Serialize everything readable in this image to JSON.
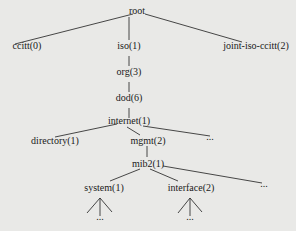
{
  "diagram": {
    "type": "tree",
    "nodes": [
      {
        "id": "root",
        "label": "root",
        "x": 149,
        "y": 12
      },
      {
        "id": "ccitt",
        "label": "ccitt(0)",
        "x": 30,
        "y": 45
      },
      {
        "id": "iso",
        "label": "iso(1)",
        "x": 130,
        "y": 45
      },
      {
        "id": "joint",
        "label": "joint-iso-ccitt(2)",
        "x": 257,
        "y": 45
      },
      {
        "id": "org",
        "label": "org(3)",
        "x": 130,
        "y": 72
      },
      {
        "id": "dod",
        "label": "dod(6)",
        "x": 130,
        "y": 98
      },
      {
        "id": "internet",
        "label": "internet(1)",
        "x": 130,
        "y": 123
      },
      {
        "id": "directory",
        "label": "directory(1)",
        "x": 55,
        "y": 141
      },
      {
        "id": "mgmt",
        "label": "mgmt(2)",
        "x": 147,
        "y": 141
      },
      {
        "id": "internet_more",
        "label": "...",
        "x": 212,
        "y": 140
      },
      {
        "id": "mib2",
        "label": "mib2(1)",
        "x": 150,
        "y": 163
      },
      {
        "id": "system",
        "label": "system(1)",
        "x": 103,
        "y": 187
      },
      {
        "id": "interface",
        "label": "interface(2)",
        "x": 191,
        "y": 187
      },
      {
        "id": "mib2_more",
        "label": "...",
        "x": 265,
        "y": 187
      },
      {
        "id": "system_more",
        "label": "...",
        "x": 98,
        "y": 219
      },
      {
        "id": "interface_more",
        "label": "...",
        "x": 190,
        "y": 219
      }
    ]
  }
}
